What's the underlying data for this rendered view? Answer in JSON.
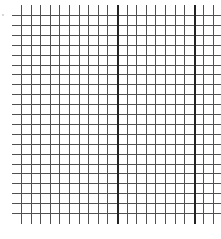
{
  "figure": {
    "type": "grid-paper",
    "background": "#ffffff",
    "line_color": "#505050",
    "thick_line_color": "#222222",
    "grid": {
      "vertical_lines": 21,
      "horizontal_lines": 21,
      "x_start": 21,
      "x_spacing": 9.6,
      "y_start": 15,
      "y_spacing": 9.9,
      "h_line_left": 12,
      "h_line_right": 221,
      "v_line_top": 5,
      "v_line_bottom": 224,
      "thick_vertical_indices": [
        10,
        18
      ]
    }
  }
}
